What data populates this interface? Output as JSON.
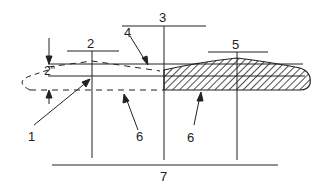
{
  "diagram": {
    "labels": {
      "l1": "1",
      "l2": "2",
      "l3": "3",
      "l4": "4",
      "l5": "5",
      "l6a": "6",
      "l6b": "6",
      "l7": "7",
      "dim": "2\""
    }
  }
}
